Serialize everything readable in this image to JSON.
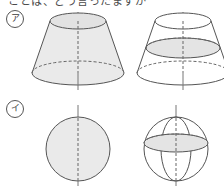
{
  "page": {
    "background_color": "#ffffff",
    "width": 224,
    "height": 187,
    "clipped_header_text": "ことは、どう言ったますか",
    "line_color": "#555555",
    "dash_color": "#666666",
    "axis_color": "#777777",
    "shade_color": "#eaeaea"
  },
  "rows": [
    {
      "marker": "ア",
      "marker_name": "row-label-a",
      "description": "truncated cone (frustum)",
      "figures": [
        {
          "name": "frustum-solid",
          "shaded": "body",
          "axis": "vertical",
          "top_radius_x": 28,
          "bottom_radius_x": 46,
          "height": 52
        },
        {
          "name": "frustum-cross-section",
          "shaded": "cross-section-ellipse",
          "axis": "vertical",
          "top_radius_x": 28,
          "bottom_radius_x": 46,
          "height": 52
        }
      ]
    },
    {
      "marker": "イ",
      "marker_name": "row-label-i",
      "description": "sphere",
      "figures": [
        {
          "name": "sphere-solid",
          "shaded": "body",
          "axis": "vertical",
          "radius": 32
        },
        {
          "name": "sphere-cross-section",
          "shaded": "equator-ellipse",
          "axis": "vertical",
          "radius": 32
        }
      ]
    }
  ]
}
